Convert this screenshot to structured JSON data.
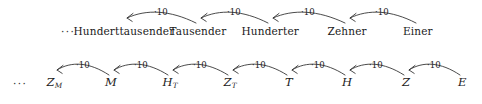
{
  "diagram": {
    "background_color": "#ffffff",
    "ink_color": "#1a1a1a",
    "leading_ellipsis": "···",
    "arrow_label": "·10",
    "rows": [
      {
        "id": "place-value-names",
        "ellipsis": "···",
        "nodes": [
          {
            "label": "Hunderttausender",
            "x": 124,
            "y": 34
          },
          {
            "label": "Tausender",
            "x": 198,
            "y": 34
          },
          {
            "label": "Hunderter",
            "x": 270,
            "y": 34
          },
          {
            "label": "Zehner",
            "x": 347,
            "y": 34
          },
          {
            "label": "Einer",
            "x": 418,
            "y": 34
          }
        ],
        "arrows": [
          {
            "label": "·10",
            "from_x": 198,
            "to_x": 124,
            "y": 21,
            "label_x": 161,
            "label_y": 8
          },
          {
            "label": "·10",
            "from_x": 270,
            "to_x": 198,
            "y": 21,
            "label_x": 234,
            "label_y": 8
          },
          {
            "label": "·10",
            "from_x": 347,
            "to_x": 270,
            "y": 21,
            "label_x": 308,
            "label_y": 8
          },
          {
            "label": "·10",
            "from_x": 418,
            "to_x": 347,
            "y": 21,
            "label_x": 382,
            "label_y": 8
          }
        ]
      },
      {
        "id": "place-value-symbols",
        "ellipsis": "···",
        "nodes": [
          {
            "label": "Z",
            "sub": "M",
            "x": 54,
            "y": 34
          },
          {
            "label": "M",
            "sub": "",
            "x": 111,
            "y": 34
          },
          {
            "label": "H",
            "sub": "T",
            "x": 170,
            "y": 34
          },
          {
            "label": "Z",
            "sub": "T",
            "x": 230,
            "y": 34
          },
          {
            "label": "T",
            "sub": "",
            "x": 289,
            "y": 34
          },
          {
            "label": "H",
            "sub": "",
            "x": 347,
            "y": 34
          },
          {
            "label": "Z",
            "sub": "",
            "x": 406,
            "y": 34
          },
          {
            "label": "E",
            "sub": "",
            "x": 462,
            "y": 34
          }
        ],
        "arrows": [
          {
            "label": "·10",
            "from_x": 111,
            "to_x": 54,
            "y": 21,
            "label_x": 83,
            "label_y": 9
          },
          {
            "label": "·10",
            "from_x": 170,
            "to_x": 111,
            "y": 21,
            "label_x": 141,
            "label_y": 9
          },
          {
            "label": "·10",
            "from_x": 230,
            "to_x": 170,
            "y": 21,
            "label_x": 200,
            "label_y": 9
          },
          {
            "label": "·10",
            "from_x": 289,
            "to_x": 230,
            "y": 21,
            "label_x": 259,
            "label_y": 9
          },
          {
            "label": "·10",
            "from_x": 347,
            "to_x": 289,
            "y": 21,
            "label_x": 318,
            "label_y": 9
          },
          {
            "label": "·10",
            "from_x": 406,
            "to_x": 347,
            "y": 21,
            "label_x": 376,
            "label_y": 9
          },
          {
            "label": "·10",
            "from_x": 462,
            "to_x": 406,
            "y": 21,
            "label_x": 434,
            "label_y": 9
          }
        ]
      }
    ],
    "ellipsis_positions": [
      {
        "row": 0,
        "x": 68,
        "y": 34
      },
      {
        "row": 1,
        "x": 20,
        "y": 34
      }
    ]
  }
}
